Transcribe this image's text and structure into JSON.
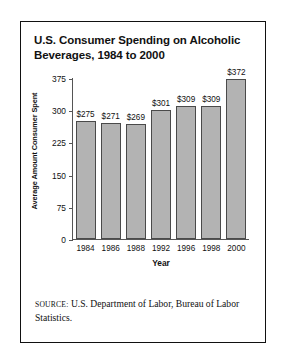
{
  "figure": {
    "title": "U.S. Consumer Spending on Alcoholic Beverages, 1984 to 2000",
    "source_label": "SOURCE:",
    "source_text": " U.S. Department of Labor, Bureau of Labor Statistics."
  },
  "chart_data": {
    "type": "bar",
    "title": "U.S. Consumer Spending on Alcoholic Beverages, 1984 to 2000",
    "xlabel": "Year",
    "ylabel": "Average Amount Consumer Spent",
    "categories": [
      "1984",
      "1986",
      "1988",
      "1992",
      "1996",
      "1998",
      "2000"
    ],
    "values": [
      275,
      271,
      269,
      301,
      309,
      309,
      372
    ],
    "data_labels": [
      "$275",
      "$271",
      "$269",
      "$301",
      "$309",
      "$309",
      "$372"
    ],
    "yticks": [
      375,
      300,
      225,
      150,
      75,
      0
    ],
    "ytick_labels": [
      "375",
      "300",
      "225",
      "150",
      "75",
      "0"
    ],
    "ylim": [
      0,
      375
    ],
    "grid": false,
    "legend": false,
    "bar_color": "#b3b3b3",
    "bar_edge_color": "#4a4a4a",
    "axis_color": "#555555",
    "text_color": "#111111"
  }
}
